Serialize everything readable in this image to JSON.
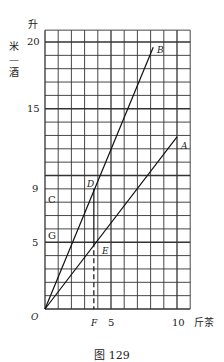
{
  "figure": {
    "caption": "图 129",
    "y_unit": "升",
    "y_axis_label": "米—酒",
    "y_axis_label_chars": [
      "米",
      "—",
      "酒"
    ],
    "x_axis_label": "斤茶",
    "origin_label": "O",
    "x_ticks": [
      "5",
      "10"
    ],
    "y_ticks": [
      "5",
      "9",
      "15",
      "20"
    ],
    "point_labels": {
      "A": "A",
      "B": "B",
      "C": "C",
      "D": "D",
      "E": "E",
      "F": "F",
      "G": "G"
    }
  },
  "chart_data": {
    "type": "line",
    "title": "图 129",
    "xlabel": "斤茶",
    "ylabel": "米—酒 (升)",
    "xlim": [
      0,
      11
    ],
    "ylim": [
      0,
      21
    ],
    "grid": true,
    "x_tick_labels": [
      5,
      10
    ],
    "y_tick_labels": [
      5,
      9,
      15,
      20
    ],
    "series": [
      {
        "name": "OB",
        "x": [
          0,
          8.2
        ],
        "y": [
          0,
          19.6
        ],
        "end_label": "B"
      },
      {
        "name": "OA",
        "x": [
          0,
          10
        ],
        "y": [
          0,
          12.9
        ],
        "end_label": "A"
      }
    ],
    "annotations": [
      {
        "label": "D",
        "x": 3.7,
        "y": 9,
        "note": "intersection of OB with y=9"
      },
      {
        "label": "E",
        "x": 3.7,
        "y": 5,
        "note": "intersection of OA with y=5"
      },
      {
        "label": "F",
        "x": 3.7,
        "y": 0,
        "note": "foot of dashed vertical from E"
      },
      {
        "label": "C",
        "x": 0,
        "y": 9,
        "note": "y-axis label near 9"
      },
      {
        "label": "G",
        "x": 0,
        "y": 5,
        "note": "y-axis label near 5"
      }
    ],
    "guides": [
      {
        "type": "solid",
        "from": [
          3.7,
          9
        ],
        "to": [
          3.7,
          5
        ]
      },
      {
        "type": "dashed",
        "from": [
          3.7,
          5
        ],
        "to": [
          3.7,
          0
        ]
      }
    ]
  }
}
